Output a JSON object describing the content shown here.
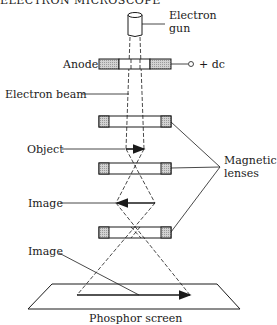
{
  "heading": "ELECTRON MICROSCOPE",
  "labels": {
    "electron_gun_line1": "Electron",
    "electron_gun_line2": "gun",
    "anode": "Anode",
    "dc_supply": "+ dc",
    "electron_beam": "Electron beam",
    "object": "Object",
    "magnetic_lenses_line1": "Magnetic",
    "magnetic_lenses_line2": "lenses",
    "image_intermediate": "Image",
    "image_final": "Image",
    "phosphor_screen": "Phosphor screen"
  },
  "colors": {
    "stroke": "#1a1a1a",
    "hatch_fill": "#c9c9c9",
    "background": "#ffffff"
  }
}
